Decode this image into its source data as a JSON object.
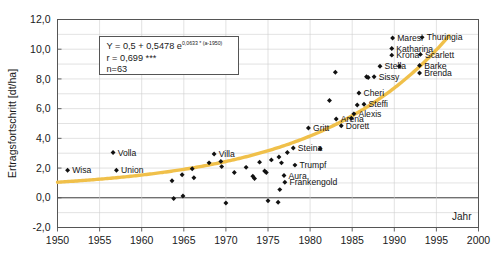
{
  "chart_data": {
    "type": "scatter",
    "title": "",
    "xlabel": "Jahr",
    "ylabel": "Ertragsfortschritt [dt/ha]",
    "xlim": [
      1950,
      2000
    ],
    "ylim": [
      -2.0,
      12.0
    ],
    "xticks": [
      "1950",
      "1955",
      "1960",
      "1965",
      "1970",
      "1975",
      "1980",
      "1985",
      "1990",
      "1995",
      "2000"
    ],
    "yticks": [
      "12,0",
      "10,0",
      "8,0",
      "6,0",
      "4,0",
      "2,0",
      "0,0",
      "-2,0"
    ],
    "grid": true,
    "legend": "none",
    "annotation": {
      "equation_prefix": "Y = 0,5 + 0,5478 e",
      "equation_exponent": "0,0633 * (a-1950)",
      "correlation": "r = 0,699 ***",
      "sample_size": "n=63"
    },
    "series": [
      {
        "name": "Ertragsfortschritt",
        "marker": "diamond",
        "color": "#111111",
        "points": [
          {
            "x": 1956.6,
            "y": 3.05,
            "label": "Volla",
            "label_pos": "right"
          },
          {
            "x": 1951.2,
            "y": 1.85,
            "label": "Wisa",
            "label_pos": "right"
          },
          {
            "x": 1957.0,
            "y": 1.85,
            "label": "Union",
            "label_pos": "right"
          },
          {
            "x": 1963.6,
            "y": 1.15,
            "label": "",
            "label_pos": "right"
          },
          {
            "x": 1963.8,
            "y": -0.05,
            "label": "",
            "label_pos": "right"
          },
          {
            "x": 1964.9,
            "y": 0.12,
            "label": "",
            "label_pos": "right"
          },
          {
            "x": 1964.8,
            "y": 1.55,
            "label": "",
            "label_pos": "right"
          },
          {
            "x": 1966.0,
            "y": 1.95,
            "label": "",
            "label_pos": "right"
          },
          {
            "x": 1966.2,
            "y": 1.35,
            "label": "",
            "label_pos": "right"
          },
          {
            "x": 1968.0,
            "y": 2.35,
            "label": "",
            "label_pos": "right"
          },
          {
            "x": 1968.6,
            "y": 2.95,
            "label": "Villa",
            "label_pos": "right"
          },
          {
            "x": 1969.4,
            "y": 2.45,
            "label": "",
            "label_pos": "right"
          },
          {
            "x": 1969.5,
            "y": 2.1,
            "label": "",
            "label_pos": "right"
          },
          {
            "x": 1970.0,
            "y": -0.35,
            "label": "",
            "label_pos": "right"
          },
          {
            "x": 1971.0,
            "y": 1.7,
            "label": "",
            "label_pos": "right"
          },
          {
            "x": 1972.4,
            "y": 2.05,
            "label": "",
            "label_pos": "right"
          },
          {
            "x": 1973.2,
            "y": 1.45,
            "label": "",
            "label_pos": "right"
          },
          {
            "x": 1973.4,
            "y": 1.3,
            "label": "",
            "label_pos": "right"
          },
          {
            "x": 1974.0,
            "y": 2.4,
            "label": "",
            "label_pos": "right"
          },
          {
            "x": 1974.6,
            "y": 1.8,
            "label": "",
            "label_pos": "right"
          },
          {
            "x": 1974.8,
            "y": 1.7,
            "label": "",
            "label_pos": "right"
          },
          {
            "x": 1975.4,
            "y": 2.55,
            "label": "",
            "label_pos": "right"
          },
          {
            "x": 1975.0,
            "y": -0.2,
            "label": "",
            "label_pos": "right"
          },
          {
            "x": 1976.2,
            "y": -0.3,
            "label": "",
            "label_pos": "right"
          },
          {
            "x": 1976.3,
            "y": 2.75,
            "label": "",
            "label_pos": "right"
          },
          {
            "x": 1976.6,
            "y": 2.35,
            "label": "",
            "label_pos": "right"
          },
          {
            "x": 1976.9,
            "y": 1.5,
            "label": "Aura",
            "label_pos": "right"
          },
          {
            "x": 1977.0,
            "y": 1.05,
            "label": "Frankengold",
            "label_pos": "right"
          },
          {
            "x": 1978.2,
            "y": 2.2,
            "label": "Trumpf",
            "label_pos": "right"
          },
          {
            "x": 1977.3,
            "y": 3.05,
            "label": "",
            "label_pos": "right"
          },
          {
            "x": 1978.0,
            "y": 3.35,
            "label": "Steina",
            "label_pos": "right"
          },
          {
            "x": 1976.4,
            "y": 0.55,
            "label": "",
            "label_pos": "right"
          },
          {
            "x": 1979.8,
            "y": 4.7,
            "label": "Gritt",
            "label_pos": "right"
          },
          {
            "x": 1981.2,
            "y": 3.3,
            "label": "",
            "label_pos": "right"
          },
          {
            "x": 1982.3,
            "y": 6.55,
            "label": "",
            "label_pos": "right"
          },
          {
            "x": 1983.0,
            "y": 8.45,
            "label": "",
            "label_pos": "right"
          },
          {
            "x": 1983.1,
            "y": 5.3,
            "label": "Arena",
            "label_pos": "right"
          },
          {
            "x": 1983.7,
            "y": 4.85,
            "label": "Dorett",
            "label_pos": "right"
          },
          {
            "x": 1985.2,
            "y": 5.65,
            "label": "Alexis",
            "label_pos": "right"
          },
          {
            "x": 1984.9,
            "y": 5.35,
            "label": "",
            "label_pos": "right"
          },
          {
            "x": 1985.8,
            "y": 7.05,
            "label": "Cheri",
            "label_pos": "right"
          },
          {
            "x": 1985.6,
            "y": 6.25,
            "label": "",
            "label_pos": "right"
          },
          {
            "x": 1986.4,
            "y": 6.3,
            "label": "Steffi",
            "label_pos": "right"
          },
          {
            "x": 1986.9,
            "y": 8.1,
            "label": "",
            "label_pos": "right"
          },
          {
            "x": 1987.6,
            "y": 8.15,
            "label": "Sissy",
            "label_pos": "right"
          },
          {
            "x": 1986.7,
            "y": 8.15,
            "label": "",
            "label_pos": "right"
          },
          {
            "x": 1988.3,
            "y": 8.85,
            "label": "Stella",
            "label_pos": "right"
          },
          {
            "x": 1990.6,
            "y": 8.85,
            "label": "",
            "label_pos": "right"
          },
          {
            "x": 1989.7,
            "y": 9.6,
            "label": "Krona",
            "label_pos": "right"
          },
          {
            "x": 1989.7,
            "y": 10.05,
            "label": "Katharina",
            "label_pos": "right"
          },
          {
            "x": 1989.8,
            "y": 10.75,
            "label": "Maresi",
            "label_pos": "right"
          },
          {
            "x": 1993.3,
            "y": 10.8,
            "label": "Thuringia",
            "label_pos": "right"
          },
          {
            "x": 1993.1,
            "y": 9.65,
            "label": "Scarlett",
            "label_pos": "right"
          },
          {
            "x": 1993.0,
            "y": 8.9,
            "label": "Barke",
            "label_pos": "right"
          },
          {
            "x": 1993.0,
            "y": 8.4,
            "label": "Brenda",
            "label_pos": "right"
          }
        ]
      }
    ],
    "fit_curve": {
      "name": "Exponentieller Trend",
      "color": "#f0c04a",
      "formula": "Y = 0,5 + 0,5478 * exp(0,0633 * (a - 1950))",
      "a0": 0.5,
      "a1": 0.5478,
      "rate": 0.0633,
      "x_start": 1950,
      "x_end": 1996.5
    }
  }
}
